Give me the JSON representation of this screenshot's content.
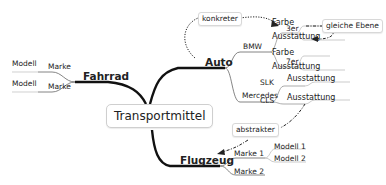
{
  "mindmap": {
    "center": "Transportmittel",
    "branches": {
      "auto": {
        "label": "Auto",
        "bmw": {
          "label": "BMW",
          "3er": {
            "label": "3er",
            "farbe": "Farbe",
            "ausstattung": "Ausstattung"
          },
          "7er": {
            "label": "7er",
            "farbe": "Farbe",
            "ausstattung": "Ausstattung"
          }
        },
        "mercedes": {
          "label": "Mercedes",
          "slk": {
            "label": "SLK",
            "ausstattung": "Ausstattung"
          },
          "cls": {
            "label": "CLS",
            "ausstattung": "Ausstattung"
          }
        }
      },
      "fahrrad": {
        "label": "Fahrrad",
        "marke1": {
          "label": "Marke",
          "modell": "Modell"
        },
        "marke2": {
          "label": "Marke",
          "modell": "Modell"
        }
      },
      "flugzeug": {
        "label": "Flugzeug",
        "marke1": {
          "label": "Marke 1",
          "modell1": "Modell 1",
          "modell2": "Modell 2"
        },
        "marke2": {
          "label": "Marke 2"
        }
      }
    },
    "annotations": {
      "konkreter": "konkreter",
      "gleiche_ebene": "gleiche Ebene",
      "abstrakter": "abstrakter"
    }
  }
}
